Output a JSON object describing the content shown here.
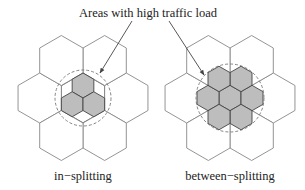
{
  "annotation": {
    "text": "Areas with high traffic load"
  },
  "diagrams": [
    {
      "id": "in-splitting",
      "caption": "in−splitting",
      "center": [
        83,
        98
      ],
      "big_hex_radius": 25,
      "small_hex_radius": 12.5,
      "highlight_circle_radius": 28,
      "small_hex_count": 3
    },
    {
      "id": "between-splitting",
      "caption": "between−splitting",
      "center": [
        230,
        98
      ],
      "big_hex_radius": 25,
      "small_hex_radius": 12.7,
      "highlight_circle_radius": 34,
      "small_hex_count": 7
    }
  ],
  "colors": {
    "cell_stroke": "#888888",
    "small_cell_fill": "#bdbdbd",
    "small_cell_stroke": "#444444",
    "circle_stroke": "#777777",
    "text": "#222222"
  }
}
